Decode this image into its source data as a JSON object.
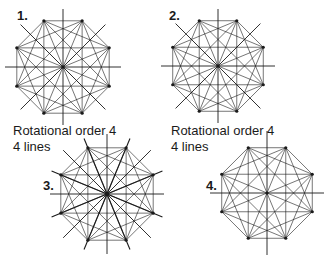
{
  "figures": [
    {
      "number": "1.",
      "caption_line1": "Rotational order 4",
      "caption_line2": "4 lines"
    },
    {
      "number": "2.",
      "caption_line1": "Rotational order 4",
      "caption_line2": "4 lines"
    },
    {
      "number": "3."
    },
    {
      "number": "4."
    }
  ],
  "colors": {
    "stroke": "#1a1a1a",
    "background": "#ffffff"
  }
}
